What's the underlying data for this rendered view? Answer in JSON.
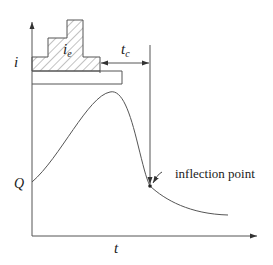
{
  "diagram": {
    "type": "hyetograph-hydrograph",
    "axes": {
      "y_label_top": "i",
      "y_label_bottom": "Q",
      "x_label": "t"
    },
    "hyetograph": {
      "effective_rainfall_label": "i",
      "effective_rainfall_subscript": "e",
      "hatched": true
    },
    "lag": {
      "label": "t",
      "subscript": "c"
    },
    "annotation": {
      "inflection_label": "inflection point"
    },
    "colors": {
      "line": "#555555",
      "text": "#222222",
      "background": "#ffffff"
    }
  }
}
